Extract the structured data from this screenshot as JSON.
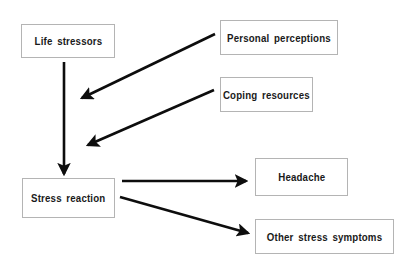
{
  "diagram": {
    "background_color": "#ffffff",
    "box_border_color": "#b4b4b4",
    "arrow_color": "#0d0d0d",
    "text_color": "#1a1a1a",
    "nodes": [
      {
        "id": "life-stressors",
        "label": "Life  stressors",
        "x": 21,
        "y": 24,
        "width": 94,
        "height": 34
      },
      {
        "id": "personal-perceptions",
        "label": "Personal  perceptions",
        "x": 220,
        "y": 20,
        "width": 118,
        "height": 35
      },
      {
        "id": "coping-resources",
        "label": "Coping  resources",
        "x": 220,
        "y": 77,
        "width": 93,
        "height": 35
      },
      {
        "id": "stress-reaction",
        "label": "Stress  reaction",
        "x": 22,
        "y": 178,
        "width": 93,
        "height": 40
      },
      {
        "id": "headache",
        "label": "Headache",
        "x": 255,
        "y": 158,
        "width": 93,
        "height": 38
      },
      {
        "id": "other-stress-symptoms",
        "label": "Other  stress  symptoms",
        "x": 255,
        "y": 219,
        "width": 139,
        "height": 35
      }
    ],
    "edges": [
      {
        "id": "life-stressors-to-stress-reaction",
        "from": "life-stressors",
        "to": "stress-reaction",
        "x1": 64,
        "y1": 62,
        "x2": 64,
        "y2": 174,
        "width": 2.6
      },
      {
        "id": "personal-perceptions-to-pathway",
        "from": "personal-perceptions",
        "to": "life-stressors-to-stress-reaction",
        "x1": 215,
        "y1": 34,
        "x2": 80,
        "y2": 99,
        "width": 2.6
      },
      {
        "id": "coping-resources-to-pathway",
        "from": "coping-resources",
        "to": "life-stressors-to-stress-reaction",
        "x1": 214,
        "y1": 90,
        "x2": 86,
        "y2": 146,
        "width": 2.6
      },
      {
        "id": "stress-reaction-to-headache",
        "from": "stress-reaction",
        "to": "headache",
        "x1": 122,
        "y1": 181,
        "x2": 248,
        "y2": 181,
        "width": 2.6
      },
      {
        "id": "stress-reaction-to-other-symptoms",
        "from": "stress-reaction",
        "to": "other-stress-symptoms",
        "x1": 120,
        "y1": 197,
        "x2": 250,
        "y2": 234,
        "width": 2.6
      }
    ]
  }
}
